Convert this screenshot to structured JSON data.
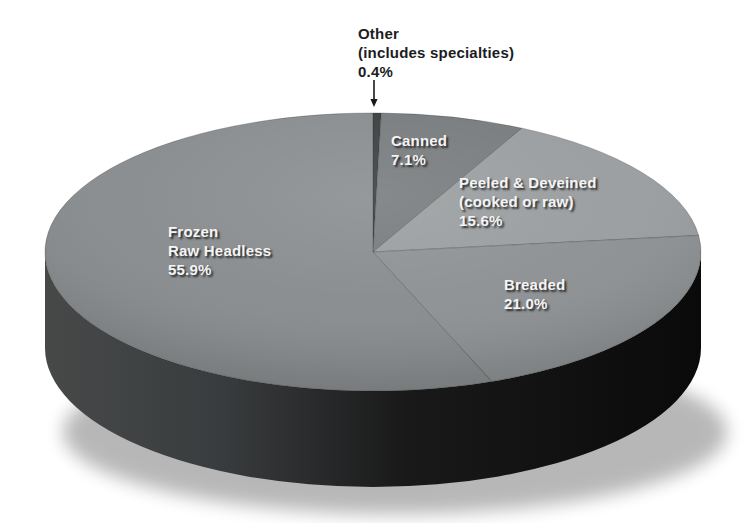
{
  "page": {
    "background": "#ffffff"
  },
  "chart_data": {
    "type": "pie",
    "title": "",
    "value_suffix": "%",
    "direction": "clockwise",
    "start_angle_deg": 0,
    "legend_position": "labels-on-slices",
    "projection": {
      "cx": 373,
      "cy": 252,
      "rx": 328,
      "ry": 139,
      "depth": 96
    },
    "slices": [
      {
        "id": "other",
        "name_lines": [
          "Other",
          "(includes specialties)"
        ],
        "value": 0.4,
        "color": "#3d3f41",
        "label": {
          "x": 358,
          "y": 24,
          "style": "outside"
        }
      },
      {
        "id": "canned",
        "name_lines": [
          "Canned"
        ],
        "value": 7.1,
        "color": "#797c7e",
        "label": {
          "x": 391,
          "y": 131,
          "style": "on-slice"
        }
      },
      {
        "id": "peeled-deveined",
        "name_lines": [
          "Peeled & Deveined",
          "(cooked or raw)"
        ],
        "value": 15.6,
        "color": "#9b9ea0",
        "label": {
          "x": 459,
          "y": 173,
          "style": "on-slice"
        }
      },
      {
        "id": "breaded",
        "name_lines": [
          "Breaded"
        ],
        "value": 21.0,
        "color": "#8f9294",
        "label": {
          "x": 504,
          "y": 275,
          "style": "on-slice"
        }
      },
      {
        "id": "frozen-raw-headless",
        "name_lines": [
          "Frozen",
          "Raw Headless"
        ],
        "value": 55.9,
        "color": "#8a8d8f",
        "label": {
          "x": 168,
          "y": 222,
          "style": "on-slice"
        }
      }
    ],
    "annotation_arrow": {
      "x": 374,
      "y_from": 80,
      "y_to": 107,
      "color": "#1a1a1a"
    },
    "side_gradient": [
      "#474949",
      "#393c3e",
      "#191919",
      "#0a0a0a"
    ],
    "shadow_color": "#000000",
    "slice_edge_color": "rgba(25,25,25,0.25)",
    "on_slice_label_color": "#f4f4f4",
    "outside_label_color": "#1c1c1e"
  }
}
